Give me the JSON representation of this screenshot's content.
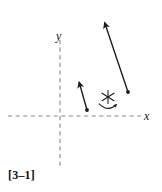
{
  "figure": {
    "caption": "[3–1]",
    "background_color": "#ffffff",
    "ink_color": "#1a1a1a",
    "axis_color": "#8a8a8a"
  },
  "axes": {
    "x_label": "x",
    "y_label": "y",
    "style": "dashed",
    "origin": {
      "x": 60,
      "y": 116
    },
    "x_axis": {
      "x1": 8,
      "y1": 116,
      "x2": 141,
      "y2": 116
    },
    "y_axis": {
      "x1": 60,
      "y1": 40,
      "x2": 60,
      "y2": 168
    }
  },
  "vectors": [
    {
      "name": "long-vector",
      "tail": {
        "x": 128,
        "y": 92
      },
      "head": {
        "x": 103,
        "y": 18
      },
      "direction": "up-left",
      "has_tail_dot": true,
      "has_arrowhead": true
    },
    {
      "name": "short-vector",
      "tail": {
        "x": 87,
        "y": 110
      },
      "head": {
        "x": 78,
        "y": 78
      },
      "direction": "up-left",
      "has_tail_dot": true,
      "has_arrowhead": true
    }
  ],
  "symbols": [
    {
      "name": "star-asterisk",
      "glyph": "asterisk-6-ray",
      "center": {
        "x": 108,
        "y": 97
      },
      "radius": 6
    },
    {
      "name": "rotation-arc",
      "glyph": "curved-arrow-clockwise",
      "start": {
        "x": 99,
        "y": 105
      },
      "end": {
        "x": 117,
        "y": 104
      },
      "sweep": "clockwise"
    }
  ]
}
